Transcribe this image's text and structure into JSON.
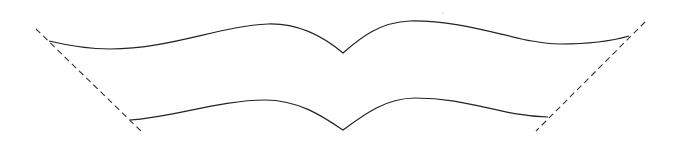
{
  "diagram": {
    "colors": {
      "stroke": "#222222",
      "dashed_stroke": "#333333",
      "background": "#ffffff"
    },
    "curves": {
      "top": "M49,41 C70,46 90,49 110,49 C170,49 220,26 268,24 C300,23 325,38 343,53 C360,38 380,22 410,21 C470,20 520,44 560,44 C590,44 612,41 629,36",
      "bottom": "M130,120 C170,118 220,100 265,100 C300,100 325,118 343,130 C362,116 385,98 415,98 C470,98 500,116 548,117"
    },
    "fold_lines": {
      "left": {
        "x1": 36,
        "y1": 29,
        "x2": 142,
        "y2": 132
      },
      "right": {
        "x1": 645,
        "y1": 22,
        "x2": 536,
        "y2": 131
      }
    }
  }
}
